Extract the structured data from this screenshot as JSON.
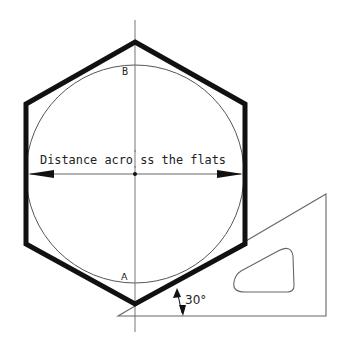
{
  "diagram": {
    "labels": {
      "dimension": "Distance acro ss the flats",
      "point_top": "B",
      "point_bottom": "A",
      "angle": "30°"
    },
    "colors": {
      "background": "#ffffff",
      "hexagon_stroke": "#111111",
      "thin_line": "#555555",
      "text": "#222222"
    },
    "geometry": {
      "center": [
        135,
        174
      ],
      "circle_radius": 109,
      "hexagon_points": [
        [
          135,
          42
        ],
        [
          245,
          104
        ],
        [
          245,
          244
        ],
        [
          135,
          304
        ],
        [
          26,
          244
        ],
        [
          26,
          104
        ]
      ],
      "triangle_points": [
        [
          118,
          316
        ],
        [
          326,
          194
        ],
        [
          326,
          316
        ]
      ],
      "angle_degrees": 30
    }
  }
}
